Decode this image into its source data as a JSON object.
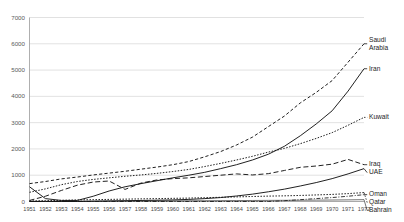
{
  "chart_data": {
    "type": "line",
    "title": "",
    "subtitle": "",
    "xlabel": "",
    "ylabel": "",
    "grid": true,
    "legend_position": "right-inline-labels",
    "ylim": [
      0,
      7000
    ],
    "ytick_step": 1000,
    "yticks": [
      "0",
      "1000",
      "2000",
      "3000",
      "4000",
      "5000",
      "6000",
      "7000"
    ],
    "x": [
      1951,
      1952,
      1953,
      1954,
      1955,
      1956,
      1957,
      1958,
      1959,
      1960,
      1961,
      1962,
      1963,
      1964,
      1965,
      1966,
      1967,
      1968,
      1969,
      1970,
      1971,
      1972
    ],
    "xtick_labels": [
      "1951",
      "1952",
      "1953",
      "1954",
      "1955",
      "1956",
      "1957",
      "1958",
      "1959",
      "1960",
      "1961",
      "1962",
      "1963",
      "1964",
      "1965",
      "1966",
      "1967",
      "1968",
      "1969",
      "1970",
      "1971",
      "1972"
    ],
    "series": [
      {
        "name": "Saudi Arabia",
        "label": "Saudi Arabia",
        "label_line1": "Saudi",
        "label_line2": "Arabia",
        "style": "dashed",
        "color": "#151515",
        "values": [
          680,
          760,
          860,
          930,
          1010,
          1080,
          1150,
          1230,
          1310,
          1400,
          1520,
          1700,
          1900,
          2150,
          2450,
          2850,
          3250,
          3750,
          4150,
          4600,
          5300,
          6000
        ]
      },
      {
        "name": "Iran",
        "label": "Iran",
        "style": "solid",
        "color": "#151515",
        "values": [
          560,
          110,
          40,
          40,
          200,
          400,
          560,
          680,
          790,
          900,
          1000,
          1110,
          1250,
          1400,
          1580,
          1800,
          2100,
          2500,
          2950,
          3450,
          4200,
          5050
        ]
      },
      {
        "name": "Kuwait",
        "label": "Kuwait",
        "style": "dotted",
        "color": "#151515",
        "values": [
          350,
          480,
          640,
          760,
          840,
          900,
          960,
          1010,
          1070,
          1140,
          1220,
          1330,
          1450,
          1580,
          1720,
          1880,
          2020,
          2200,
          2400,
          2620,
          2900,
          3200
        ]
      },
      {
        "name": "Iraq",
        "label": "Iraq",
        "style": "dashed-long",
        "color": "#151515",
        "values": [
          40,
          200,
          420,
          620,
          740,
          780,
          460,
          700,
          820,
          870,
          900,
          950,
          1000,
          1050,
          1010,
          1060,
          1180,
          1300,
          1350,
          1420,
          1600,
          1400
        ]
      },
      {
        "name": "UAE",
        "label": "UAE",
        "style": "solid",
        "color": "#151515",
        "values": [
          0,
          0,
          0,
          0,
          10,
          20,
          30,
          40,
          50,
          60,
          80,
          110,
          150,
          210,
          280,
          370,
          470,
          590,
          720,
          870,
          1050,
          1250
        ]
      },
      {
        "name": "Oman",
        "label": "Oman",
        "style": "dash-dot",
        "color": "#151515",
        "values": [
          0,
          0,
          0,
          0,
          0,
          0,
          0,
          0,
          0,
          0,
          0,
          0,
          0,
          0,
          0,
          0,
          30,
          70,
          110,
          150,
          200,
          260
        ]
      },
      {
        "name": "Qatar",
        "label": "Qatar",
        "style": "dotted",
        "color": "#151515",
        "values": [
          20,
          30,
          45,
          60,
          70,
          80,
          90,
          100,
          110,
          120,
          130,
          145,
          160,
          175,
          190,
          205,
          215,
          230,
          250,
          270,
          300,
          340
        ]
      },
      {
        "name": "Bahrain",
        "label": "Bahrain",
        "style": "solid-thin",
        "color": "#151515",
        "values": [
          8,
          10,
          12,
          14,
          16,
          18,
          20,
          22,
          24,
          26,
          28,
          30,
          33,
          36,
          39,
          42,
          45,
          48,
          52,
          56,
          62,
          70
        ]
      }
    ]
  }
}
